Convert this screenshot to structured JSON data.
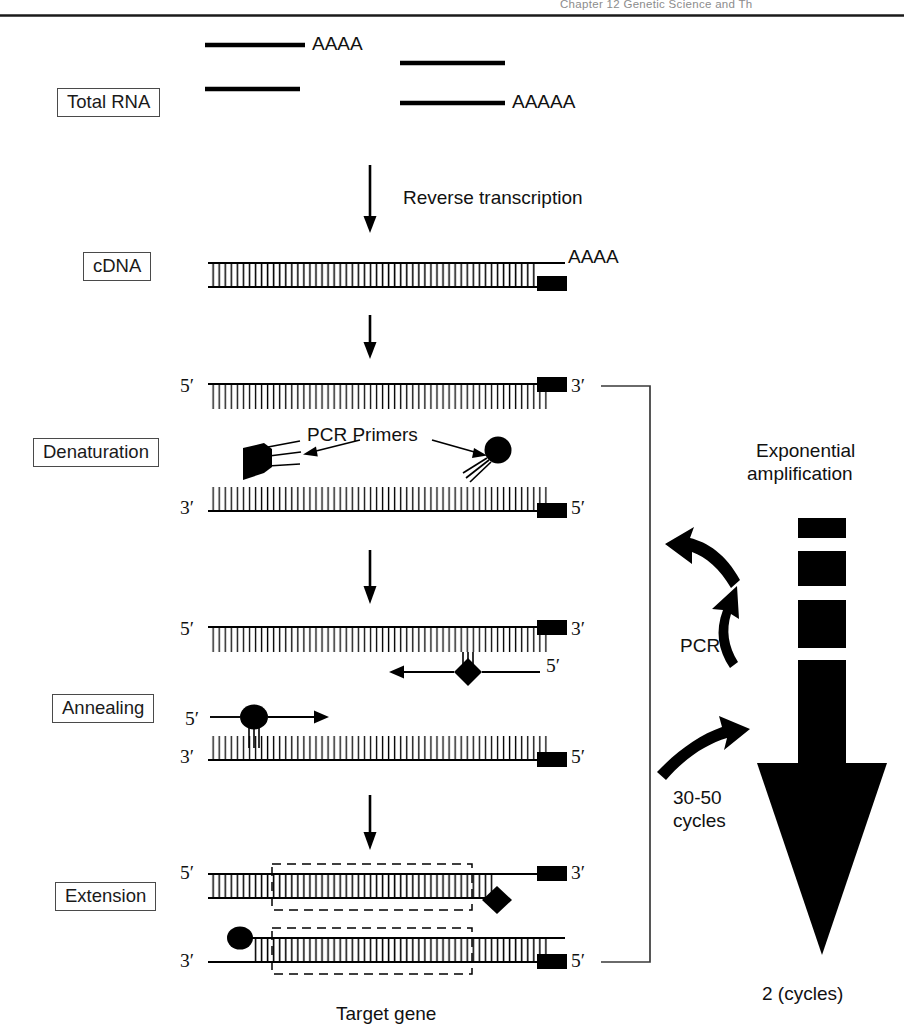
{
  "page": {
    "width": 904,
    "height": 1033,
    "background": "#ffffff",
    "ink": "#000000"
  },
  "header": {
    "running_head": "Chapter 12   Genetic Science and Th"
  },
  "stage_labels": {
    "total_rna": "Total RNA",
    "cdna": "cDNA",
    "denaturation": "Denaturation",
    "annealing": "Annealing",
    "extension": "Extension"
  },
  "annotations": {
    "reverse_transcription": "Reverse transcription",
    "pcr_primers": "PCR Primers",
    "target_gene": "Target gene",
    "pcr": "PCR",
    "cycles_30_50_line1": "30-50",
    "cycles_30_50_line2": "cycles",
    "exponential_line1": "Exponential",
    "exponential_line2": "amplification",
    "two_cycles": "2 (cycles)"
  },
  "rna_polya": {
    "strand_1_tail": "AAAA",
    "strand_4_tail": "AAAAA"
  },
  "cdna_polya": "AAAA",
  "prime_marks": {
    "five": "5′",
    "three": "3′"
  },
  "strand_ends": {
    "denaturation_top_left": "5′",
    "denaturation_top_right": "3′",
    "denaturation_bottom_left": "3′",
    "denaturation_bottom_right": "5′",
    "annealing_top_left": "5′",
    "annealing_top_right": "3′",
    "annealing_primer_diamond": "5′",
    "annealing_primer_circle": "5′",
    "annealing_bottom_left": "3′",
    "annealing_bottom_right": "5′",
    "extension_top_left": "5′",
    "extension_top_right": "3′",
    "extension_bottom_left": "3′",
    "extension_bottom_right": "5′"
  },
  "amplification_bar": {
    "segments": [
      {
        "top": 518,
        "height": 20
      },
      {
        "top": 551,
        "height": 35
      },
      {
        "top": 600,
        "height": 48
      },
      {
        "top": 660,
        "height": 104
      }
    ],
    "arrowhead_top": 763,
    "arrowhead_tip": 955
  },
  "rna_strands": [
    {
      "x1": 205,
      "x2": 305,
      "y": 45
    },
    {
      "x1": 205,
      "x2": 300,
      "y": 89
    },
    {
      "x1": 400,
      "x2": 505,
      "y": 63
    },
    {
      "x1": 400,
      "x2": 505,
      "y": 103
    }
  ]
}
